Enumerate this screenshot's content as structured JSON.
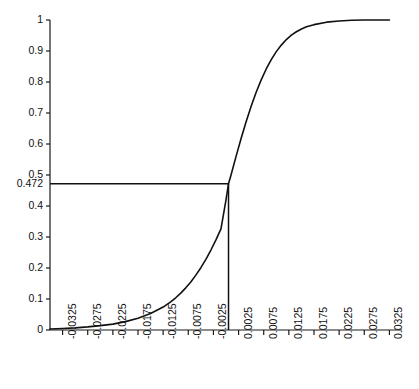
{
  "chart_data": {
    "type": "line",
    "title": "",
    "xlabel": "",
    "ylabel": "",
    "xlim": [
      -0.035,
      0.035
    ],
    "ylim": [
      0,
      1
    ],
    "grid": false,
    "legend": "none",
    "x_ticks": [
      "-0.0325",
      "-0.0275",
      "-0.0225",
      "-0.0175",
      "-0.0125",
      "-0.0075",
      "-0.0025",
      "0.0025",
      "0.0075",
      "0.0125",
      "0.0175",
      "0.0225",
      "0.0275",
      "0.0325"
    ],
    "x_tick_values": [
      -0.0325,
      -0.0275,
      -0.0225,
      -0.0175,
      -0.0125,
      -0.0075,
      -0.0025,
      0.0025,
      0.0075,
      0.0125,
      0.0175,
      0.0225,
      0.0275,
      0.0325
    ],
    "y_ticks": [
      "0",
      "0.1",
      "0.2",
      "0.3",
      "0.4",
      "0.472",
      "0.5",
      "0.6",
      "0.7",
      "0.8",
      "0.9",
      "1"
    ],
    "y_tick_values": [
      0,
      0.1,
      0.2,
      0.3,
      0.4,
      0.472,
      0.5,
      0.6,
      0.7,
      0.8,
      0.9,
      1
    ],
    "series": [
      {
        "name": "cumulative-distribution",
        "x": [
          -0.035,
          -0.0325,
          -0.03,
          -0.0275,
          -0.025,
          -0.0225,
          -0.02,
          -0.0175,
          -0.015,
          -0.0125,
          -0.011,
          -0.01,
          -0.009,
          -0.008,
          -0.007,
          -0.006,
          -0.005,
          -0.004,
          -0.003,
          -0.002,
          -0.001,
          0.0,
          0.0005,
          0.001,
          0.002,
          0.003,
          0.004,
          0.005,
          0.006,
          0.007,
          0.008,
          0.009,
          0.01,
          0.011,
          0.012,
          0.013,
          0.014,
          0.015,
          0.016,
          0.0175,
          0.02,
          0.0225,
          0.025,
          0.0275,
          0.03,
          0.0325
        ],
        "y": [
          0.003,
          0.005,
          0.007,
          0.01,
          0.014,
          0.019,
          0.027,
          0.038,
          0.053,
          0.074,
          0.091,
          0.104,
          0.119,
          0.136,
          0.155,
          0.177,
          0.201,
          0.228,
          0.258,
          0.291,
          0.326,
          0.42,
          0.472,
          0.5,
          0.56,
          0.618,
          0.672,
          0.722,
          0.767,
          0.807,
          0.842,
          0.872,
          0.898,
          0.919,
          0.937,
          0.951,
          0.962,
          0.971,
          0.978,
          0.985,
          0.993,
          0.997,
          0.999,
          1.0,
          1.0,
          1.0
        ]
      }
    ],
    "annotations": [
      {
        "name": "horizontal-reference-line",
        "type": "hline",
        "y": 0.472,
        "x_from": -0.035,
        "x_to": 0.0005,
        "label": "0.472"
      },
      {
        "name": "vertical-reference-line",
        "type": "vline",
        "x": 0.0005,
        "y_from": 0,
        "y_to": 0.472,
        "label": ""
      }
    ]
  }
}
